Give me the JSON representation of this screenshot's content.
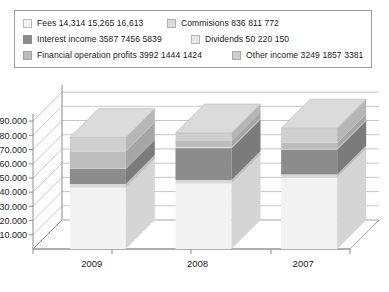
{
  "chart_data": {
    "type": "bar",
    "subtype": "stacked-column-3d",
    "title": "",
    "xlabel": "",
    "ylabel": "",
    "categories": [
      "2009",
      "2008",
      "2007"
    ],
    "ylim": [
      0,
      95000
    ],
    "ytick_labels": [
      "10.000",
      "20.000",
      "30.000",
      "40.000",
      "50.000",
      "60.000",
      "70.000",
      "80.000",
      "90.000"
    ],
    "ytick_values": [
      10000,
      20000,
      30000,
      40000,
      50000,
      60000,
      70000,
      80000,
      90000
    ],
    "grid": true,
    "legend_position": "top",
    "series": [
      {
        "name": "Fees",
        "values": [
          14314,
          15265,
          16613
        ],
        "color": "#f2f2f2"
      },
      {
        "name": "Commisions",
        "values": [
          836,
          811,
          772
        ],
        "color": "#d9d9d9"
      },
      {
        "name": "Interest income",
        "values": [
          3587,
          7456,
          5839
        ],
        "color": "#8c8c8c"
      },
      {
        "name": "Dividends",
        "values": [
          50,
          220,
          150
        ],
        "color": "#e4e4e4"
      },
      {
        "name": "Financial operation profits",
        "values": [
          3992,
          1444,
          1424
        ],
        "color": "#bdbdbd"
      },
      {
        "name": "Other income",
        "values": [
          3249,
          1857,
          3381
        ],
        "color": "#cfcfcf"
      }
    ],
    "bar_totals": [
      26028,
      27053,
      28179
    ]
  },
  "legend": {
    "rows": [
      [
        {
          "label": "Fees 14,314  15,265  16,613",
          "color": "#f4f4f4"
        },
        {
          "label": "Commisions 836  811  772",
          "color": "#dcdcdc"
        }
      ],
      [
        {
          "label": "Interest income 3587  7456  5839",
          "color": "#8a8a8a"
        },
        {
          "label": "Dividends 50  220  150",
          "color": "#e6e6e6"
        }
      ],
      [
        {
          "label": "Financial operation profits 3992 1444 1424",
          "color": "#bcbcbc"
        },
        {
          "label": "Other income 3249  1857  3381",
          "color": "#cdcdcd"
        }
      ]
    ]
  },
  "axis": {
    "y_labels": [
      "90.000",
      "80.000",
      "70.000",
      "60.000",
      "50.000",
      "40.000",
      "30.000",
      "20.000",
      "10.000"
    ],
    "x_labels": [
      "2009",
      "2008",
      "2007"
    ]
  },
  "colors": {
    "frame": "#9b9b9b",
    "grid": "#b9b9b9",
    "text": "#1b1b1b",
    "background": "#ffffff"
  }
}
